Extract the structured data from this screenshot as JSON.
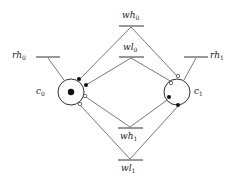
{
  "diagram": {
    "type": "petri-net",
    "places": [
      {
        "id": "c0",
        "name": "c",
        "sub": "0",
        "tokens": 1
      },
      {
        "id": "c1",
        "name": "c",
        "sub": "1",
        "tokens": 0
      }
    ],
    "transitions": [
      {
        "id": "wh0",
        "name": "wh",
        "sub": "0"
      },
      {
        "id": "wl0",
        "name": "wl",
        "sub": "0"
      },
      {
        "id": "wh1",
        "name": "wh",
        "sub": "1"
      },
      {
        "id": "wl1",
        "name": "wl",
        "sub": "1"
      },
      {
        "id": "rh0",
        "name": "rh",
        "sub": "0"
      },
      {
        "id": "rh1",
        "name": "rh",
        "sub": "1"
      }
    ],
    "arcs": [
      {
        "from": "wh0",
        "to": "c0",
        "end": "filled"
      },
      {
        "from": "wl0",
        "to": "c0",
        "end": "filled"
      },
      {
        "from": "wh0",
        "to": "c1",
        "end": "hollow"
      },
      {
        "from": "wl0",
        "to": "c1",
        "end": "hollow"
      },
      {
        "from": "wh1",
        "to": "c0",
        "end": "hollow"
      },
      {
        "from": "wl1",
        "to": "c0",
        "end": "hollow"
      },
      {
        "from": "wh1",
        "to": "c1",
        "end": "filled"
      },
      {
        "from": "wl1",
        "to": "c1",
        "end": "filled"
      },
      {
        "from": "rh0",
        "to": "c0",
        "end": "plain"
      },
      {
        "from": "rh1",
        "to": "c1",
        "end": "plain"
      }
    ]
  }
}
